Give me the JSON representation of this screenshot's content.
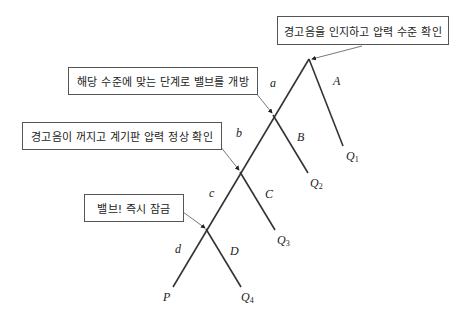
{
  "diagram": {
    "boxes": [
      {
        "id": "box-1",
        "text": "경고음을 인지하고 압력 수준 확인"
      },
      {
        "id": "box-2",
        "text": "해당 수준에 맞는 단계로 밸브를 개방"
      },
      {
        "id": "box-3",
        "text": "경고음이 꺼지고 계기판 압력 정상 확인"
      },
      {
        "id": "box-4",
        "text": "밸브! 즉시 잠금"
      }
    ],
    "left_labels": [
      "a",
      "b",
      "c",
      "d"
    ],
    "right_labels": [
      "A",
      "B",
      "C",
      "D"
    ],
    "outcomes": [
      {
        "letter": "Q",
        "sub": "1"
      },
      {
        "letter": "Q",
        "sub": "2"
      },
      {
        "letter": "Q",
        "sub": "3"
      },
      {
        "letter": "Q",
        "sub": "4"
      }
    ],
    "end_label": "P"
  }
}
